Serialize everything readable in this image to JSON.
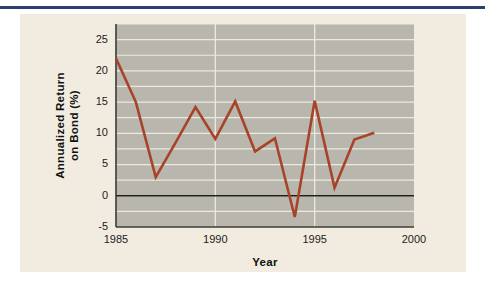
{
  "figure": {
    "background_color": "#f2ece0",
    "rule_color": "#2c3f72",
    "plot_background_color": "#b9b7ad",
    "gridline_color": "#ece9df",
    "line_color": "#a8432a",
    "axis_color": "#3a3a34"
  },
  "chart_data": {
    "type": "line",
    "title": "",
    "xlabel": "Year",
    "ylabel": "Annualized Return on Bond (%)",
    "ylabel_line1": "Annualized Return",
    "ylabel_line2": "on Bond (%)",
    "xlim": [
      1985,
      2000
    ],
    "ylim": [
      -5,
      27.5
    ],
    "xticks": [
      1985,
      1990,
      1995,
      2000
    ],
    "xtick_labels": [
      "1985",
      "1990",
      "1995",
      "2000"
    ],
    "yticks": [
      -5,
      0,
      5,
      10,
      15,
      20,
      25
    ],
    "ytick_labels": [
      "-5",
      "0",
      "5",
      "10",
      "15",
      "20",
      "25"
    ],
    "minor_gridline_step": 2.5,
    "grid": true,
    "legend": "none",
    "zero_line": 0,
    "x": [
      1985,
      1986,
      1987,
      1988,
      1989,
      1990,
      1991,
      1992,
      1993,
      1994,
      1995,
      1996,
      1997,
      1998
    ],
    "values": [
      22.0,
      15.0,
      3.0,
      8.5,
      14.2,
      9.1,
      15.1,
      7.1,
      9.2,
      -3.4,
      15.2,
      1.3,
      9.0,
      10.1
    ],
    "series": [
      {
        "name": "Annualized Return on Bond (%)",
        "color": "#a8432a",
        "values": [
          22.0,
          15.0,
          3.0,
          8.5,
          14.2,
          9.1,
          15.1,
          7.1,
          9.2,
          -3.4,
          15.2,
          1.3,
          9.0,
          10.1
        ]
      }
    ]
  }
}
